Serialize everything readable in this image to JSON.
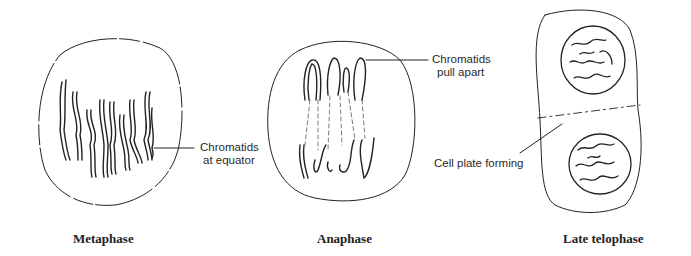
{
  "figure": {
    "panels": [
      {
        "id": "metaphase",
        "caption": "Metaphase",
        "annotation": {
          "line1": "Chromatids",
          "line2": "at equator"
        }
      },
      {
        "id": "anaphase",
        "caption": "Anaphase",
        "annotation": {
          "line1": "Chromatids",
          "line2": "pull apart"
        }
      },
      {
        "id": "late-telophase",
        "caption": "Late telophase",
        "annotation": {
          "line1": "Cell plate forming"
        }
      }
    ]
  }
}
